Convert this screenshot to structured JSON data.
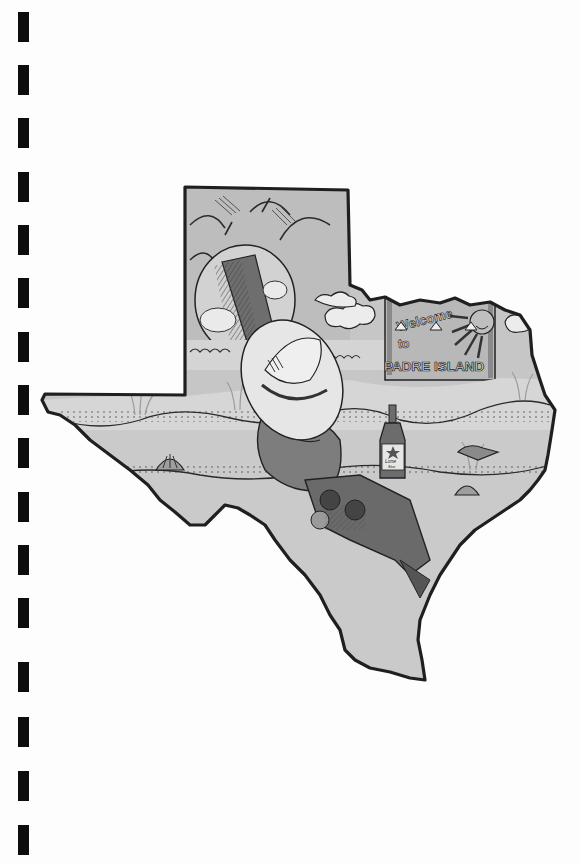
{
  "page": {
    "type": "cookbook-style printed page with spiral binding",
    "background": "#fdfdfd",
    "binding_holes": {
      "count": 16,
      "color": "#0d0d0d",
      "start_y": 12,
      "pitch": 53,
      "height": 30
    }
  },
  "illustration": {
    "subject": "Texas state outline containing a beach scene",
    "outline_color": "#222222",
    "fill_color": "#c8c8c8",
    "sign": {
      "line1": "Welcome",
      "line2": "to",
      "line3": "PADRE ISLAND"
    },
    "bottle_label": {
      "line1": "Lone",
      "line2": "Star"
    },
    "elements": [
      "sun",
      "clouds",
      "tire swing",
      "cowboy hat",
      "reclining figure",
      "beer bottle",
      "seashells",
      "dune grass",
      "waves"
    ]
  }
}
